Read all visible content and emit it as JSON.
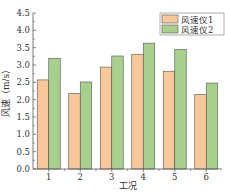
{
  "chart_data": {
    "type": "bar",
    "title": "",
    "xlabel": "工况",
    "ylabel": "风速（m/s）",
    "categories": [
      "1",
      "2",
      "3",
      "4",
      "5",
      "6"
    ],
    "series": [
      {
        "name": "风速仪1",
        "color": "#F9C89A",
        "values": [
          2.57,
          2.18,
          2.94,
          3.31,
          2.82,
          2.15
        ]
      },
      {
        "name": "风速仪2",
        "color": "#A8D08D",
        "values": [
          3.19,
          2.51,
          3.26,
          3.63,
          3.45,
          2.48
        ]
      }
    ],
    "ylim": [
      0,
      4.5
    ],
    "yticks": [
      "0.0",
      "0.5",
      "1.0",
      "1.5",
      "2.0",
      "2.5",
      "3.0",
      "3.5",
      "4.0",
      "4.5"
    ],
    "grid": false,
    "legend_position": "upper right"
  }
}
